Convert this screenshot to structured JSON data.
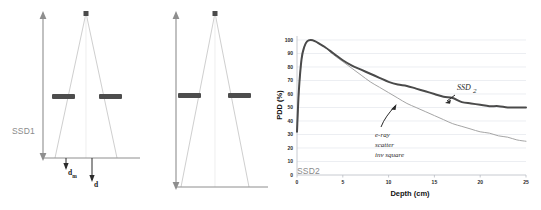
{
  "figure": {
    "background": "#ffffff",
    "width": 541,
    "height": 210
  },
  "diagrams": [
    {
      "id": "ssd1",
      "ssd_label": "SSD1",
      "source_marker": "radiation-source-point",
      "collimator_label": "collimator-jaws",
      "depth_markers": [
        {
          "id": "dm",
          "label": "d",
          "subscript": "m"
        },
        {
          "id": "d",
          "label": "d",
          "subscript": ""
        }
      ]
    },
    {
      "id": "ssd2",
      "ssd_label": "SSD2",
      "source_marker": "radiation-source-point",
      "collimator_label": "collimator-jaws",
      "depth_markers": []
    }
  ],
  "chart_data": {
    "type": "line",
    "title": "",
    "xlabel": "Depth (cm)",
    "ylabel": "PDD (%)",
    "xlim": [
      0,
      25
    ],
    "ylim": [
      0,
      100
    ],
    "xticks": [
      0,
      5,
      10,
      15,
      20,
      25
    ],
    "yticks": [
      0,
      10,
      20,
      30,
      40,
      50,
      60,
      70,
      80,
      90,
      100
    ],
    "grid": "horizontal",
    "legend": "none",
    "x": [
      0,
      0.2,
      0.5,
      0.8,
      1.1,
      1.5,
      2,
      2.5,
      3,
      4,
      5,
      6,
      7,
      8,
      9,
      10,
      11,
      12,
      13,
      14,
      15,
      16,
      17,
      18,
      19,
      20,
      21,
      22,
      23,
      24,
      25
    ],
    "series": [
      {
        "name": "SSD2",
        "style": "thick",
        "color": "#4a4a4a",
        "values": [
          32,
          62,
          86,
          95,
          99,
          100,
          99,
          97,
          95,
          90,
          85,
          81,
          78,
          75,
          72,
          69,
          67,
          66,
          64,
          62,
          60,
          58,
          57,
          54,
          53,
          52,
          51,
          51,
          50,
          50,
          50
        ]
      },
      {
        "name": "SSD1",
        "style": "thin",
        "color": "#a5a5a5",
        "values": [
          32,
          62,
          86,
          95,
          99,
          100,
          99,
          97,
          95,
          89,
          84,
          79,
          74,
          69,
          65,
          61,
          57,
          53,
          50,
          47,
          44,
          41,
          38,
          36,
          34,
          32,
          31,
          29,
          28,
          26,
          25
        ]
      }
    ],
    "annotations": [
      {
        "id": "ssd2-callout",
        "text": "SSD",
        "subscript": "2",
        "points_to": "thick-curve",
        "x": 17,
        "y": 60
      },
      {
        "id": "scatter-callout",
        "lines": [
          "e-ray",
          "scatter",
          "inv square"
        ],
        "points_to": "curve-divergence",
        "x": 10.5,
        "y": 55
      }
    ]
  }
}
